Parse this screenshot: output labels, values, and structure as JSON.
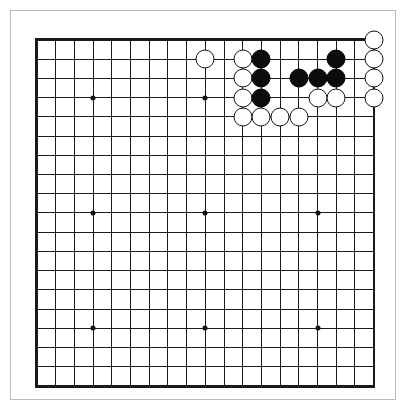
{
  "app": {
    "title": "Go Board Diagram",
    "background_color": "#ffffff"
  },
  "board": {
    "name": "goban",
    "size": 19,
    "line_color": "#1a1a1a",
    "board_color": "#ffffff",
    "black_stone_color": "#0b0b0b",
    "white_stone_color": "#ffffff",
    "origin_x": 37,
    "origin_y": 40,
    "spacing_x": 18.7,
    "spacing_y": 19.22,
    "stone_diameter": 19,
    "hoshi_points": [
      {
        "col": 4,
        "row": 4
      },
      {
        "col": 10,
        "row": 4
      },
      {
        "col": 16,
        "row": 4
      },
      {
        "col": 4,
        "row": 10
      },
      {
        "col": 10,
        "row": 10
      },
      {
        "col": 16,
        "row": 10
      },
      {
        "col": 4,
        "row": 16
      },
      {
        "col": 10,
        "row": 16
      },
      {
        "col": 16,
        "row": 16
      }
    ],
    "stones": [
      {
        "col": 19,
        "row": 1,
        "color": "white"
      },
      {
        "col": 10,
        "row": 2,
        "color": "white"
      },
      {
        "col": 12,
        "row": 2,
        "color": "white"
      },
      {
        "col": 13,
        "row": 2,
        "color": "black"
      },
      {
        "col": 17,
        "row": 2,
        "color": "black"
      },
      {
        "col": 19,
        "row": 2,
        "color": "white"
      },
      {
        "col": 12,
        "row": 3,
        "color": "white"
      },
      {
        "col": 13,
        "row": 3,
        "color": "black"
      },
      {
        "col": 15,
        "row": 3,
        "color": "black"
      },
      {
        "col": 16,
        "row": 3,
        "color": "black"
      },
      {
        "col": 17,
        "row": 3,
        "color": "black"
      },
      {
        "col": 19,
        "row": 3,
        "color": "white"
      },
      {
        "col": 12,
        "row": 4,
        "color": "white"
      },
      {
        "col": 13,
        "row": 4,
        "color": "black"
      },
      {
        "col": 16,
        "row": 4,
        "color": "white"
      },
      {
        "col": 17,
        "row": 4,
        "color": "white"
      },
      {
        "col": 19,
        "row": 4,
        "color": "white"
      },
      {
        "col": 12,
        "row": 5,
        "color": "white"
      },
      {
        "col": 13,
        "row": 5,
        "color": "white"
      },
      {
        "col": 14,
        "row": 5,
        "color": "white"
      },
      {
        "col": 15,
        "row": 5,
        "color": "white"
      }
    ],
    "stone_counts": {
      "black": 9,
      "white": 12,
      "total": 21
    }
  }
}
